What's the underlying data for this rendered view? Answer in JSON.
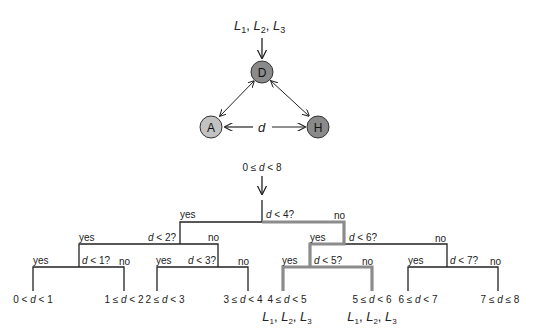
{
  "model": {
    "inputs": {
      "base": "L",
      "subs": [
        "1",
        "2",
        "3"
      ]
    },
    "nodes": [
      {
        "id": "D",
        "label": "D",
        "color": "#8a8a8a"
      },
      {
        "id": "A",
        "label": "A",
        "color": "#c2c2c2"
      },
      {
        "id": "H",
        "label": "H",
        "color": "#8a8a8a"
      }
    ],
    "edge_label": "d"
  },
  "tree": {
    "root_label": {
      "pre": "0 ≤ ",
      "var": "d",
      "post": " < 8"
    },
    "questions": {
      "q4": {
        "var": "d",
        "post": " < 4?"
      },
      "q2": {
        "var": "d",
        "post": " < 2?"
      },
      "q6": {
        "var": "d",
        "post": " < 6?"
      },
      "q1": {
        "var": "d",
        "post": " < 1?"
      },
      "q3": {
        "var": "d",
        "post": " < 3?"
      },
      "q5": {
        "var": "d",
        "post": " < 5?"
      },
      "q7": {
        "var": "d",
        "post": " < 7?"
      }
    },
    "yes": "yes",
    "no": "no",
    "leaves": [
      {
        "pre": "0 < ",
        "var": "d",
        "post": " < 1"
      },
      {
        "pre": "1 ≤ ",
        "var": "d",
        "post": " < 2"
      },
      {
        "pre": "2 ≤ ",
        "var": "d",
        "post": " < 3"
      },
      {
        "pre": "3 ≤ ",
        "var": "d",
        "post": " < 4"
      },
      {
        "pre": "4 ≤ ",
        "var": "d",
        "post": " < 5"
      },
      {
        "pre": "5 ≤ ",
        "var": "d",
        "post": " < 6"
      },
      {
        "pre": "6 ≤ ",
        "var": "d",
        "post": " < 7"
      },
      {
        "pre": "7 ≤ ",
        "var": "d",
        "post": " ≤ 8"
      }
    ],
    "highlight_color": "#8c8c8c",
    "line_color": "#222222"
  }
}
